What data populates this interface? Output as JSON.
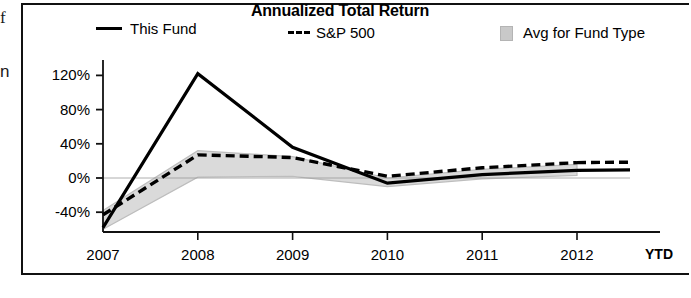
{
  "edge": {
    "glyph_top": "f",
    "glyph_mid": "n"
  },
  "chart_data": {
    "type": "line",
    "title": "Annualized Total Return",
    "xlabel": "",
    "ylabel": "",
    "grid": false,
    "legend_position": "top",
    "x": [
      "2007",
      "2008",
      "2009",
      "2010",
      "2011",
      "2012"
    ],
    "xtick_labels": [
      "2007",
      "2008",
      "2009",
      "2010",
      "2011",
      "2012"
    ],
    "xtick_suffix": "YTD",
    "ytick_labels": [
      "120%",
      "80%",
      "40%",
      "0%",
      "-40%"
    ],
    "ytick_values": [
      120,
      80,
      40,
      0,
      -40
    ],
    "ylim": [
      -62,
      135
    ],
    "series": [
      {
        "name": "This Fund",
        "style": "solid",
        "color": "#000000",
        "values": [
          -58,
          122,
          36,
          -6,
          4,
          9
        ]
      },
      {
        "name": "S&P 500",
        "style": "dashed",
        "color": "#000000",
        "values": [
          -43,
          27,
          24,
          2,
          12,
          18
        ]
      },
      {
        "name": "Avg for Fund Type",
        "style": "band",
        "color": "#cfcfcf",
        "band_upper": [
          -38,
          32,
          25,
          0,
          10,
          16
        ],
        "band_lower": [
          -60,
          1,
          2,
          -10,
          -1,
          3
        ]
      }
    ],
    "legend": [
      {
        "label": "This Fund",
        "marker": "solid-line"
      },
      {
        "label": "S&P 500",
        "marker": "dashed-line"
      },
      {
        "label": "Avg for Fund Type",
        "marker": "shaded-band"
      }
    ],
    "colors": {
      "line": "#000000",
      "band_fill": "#d4d4d4",
      "band_edge": "#bdbdbd",
      "axis": "#111111"
    }
  }
}
